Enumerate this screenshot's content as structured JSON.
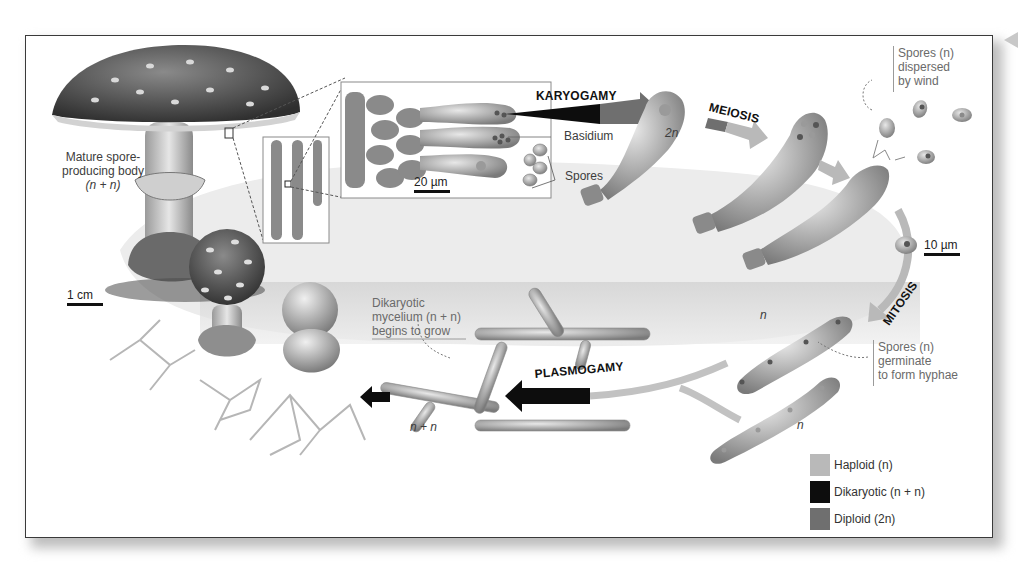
{
  "figure": {
    "corner_marker": "triangle-left"
  },
  "labels": {
    "mature_body": {
      "line1": "Mature spore-",
      "line2": "producing body",
      "line3": "(n + n)"
    },
    "basidium": "Basidium",
    "spores": "Spores",
    "two_n": "2n",
    "spores_dispersed": {
      "line1": "Spores (n)",
      "line2": "dispersed",
      "line3": "by wind"
    },
    "spores_germinate": {
      "line1": "Spores (n)",
      "line2": "germinate",
      "line3": "to form hyphae"
    },
    "dikaryotic_mycelium": {
      "line1": "Dikaryotic",
      "line2": "mycelium (n + n)",
      "line3": "begins to grow"
    },
    "n_upper": "n",
    "n_lower": "n",
    "n_plus_n": "n + n"
  },
  "stages": {
    "karyogamy": "KARYOGAMY",
    "meiosis": "MEIOSIS",
    "mitosis": "MITOSIS",
    "plasmogamy": "PLASMOGAMY"
  },
  "scale_bars": {
    "cm": "1 cm",
    "um20": "20 µm",
    "um10": "10 µm"
  },
  "legend": [
    {
      "label": "Haploid (n)",
      "color": "#b9b9b9"
    },
    {
      "label": "Dikaryotic (n + n)",
      "color": "#0d0d0d"
    },
    {
      "label": "Diploid (2n)",
      "color": "#6f6f6f"
    }
  ],
  "colors": {
    "haploid": "#b9b9b9",
    "dikaryotic": "#0d0d0d",
    "diploid": "#6f6f6f",
    "cycle_band": "#e4e4e4",
    "frame_border": "#3a3a3a"
  }
}
